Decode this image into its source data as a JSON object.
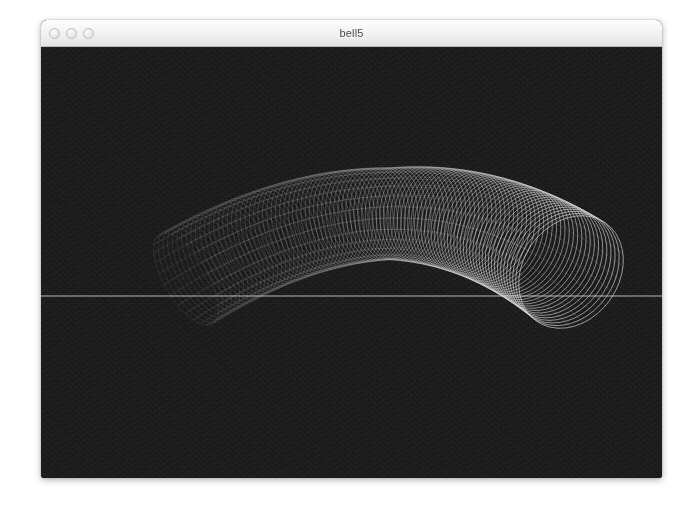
{
  "window": {
    "title": "bell5",
    "controls": [
      {
        "name": "close-button",
        "label": "close"
      },
      {
        "name": "minimize-button",
        "label": "minimize"
      },
      {
        "name": "zoom-button",
        "label": "zoom"
      }
    ],
    "frame": {
      "x": 41,
      "y": 20,
      "width": 621,
      "height": 458
    },
    "titlebar_height": 27
  },
  "canvas": {
    "name": "3d-wireframe-viewport",
    "width": 621,
    "height": 431,
    "background_color": "#141414",
    "wireframe_color": "#e8e8e8",
    "ground_line_color": "#cfcfcf"
  },
  "scene": {
    "object_name": "bell-tube-wireframe",
    "description": "Arched wireframe tube (bell curve sweep) rendered as a stack of overlapping circular cross-section rings",
    "ground_line_y": 249,
    "ring_count": 96,
    "ring_segments": 40,
    "path": {
      "start": {
        "x": 145,
        "y": 232
      },
      "peak": {
        "x": 360,
        "y": 105
      },
      "end": {
        "x": 530,
        "y": 225
      }
    },
    "radius": {
      "start": 52,
      "peak": 46,
      "end": 60
    },
    "near_end": "right",
    "far_end": "left"
  },
  "colors": {
    "titlebar_top": "#fdfdfd",
    "titlebar_bottom": "#e2e2e2",
    "titlebar_border": "#b9b9b9",
    "title_text": "#4a4a4a",
    "traffic_light_fill": "#eaeaea",
    "traffic_light_border": "#bdbdbd",
    "page_background": "#ffffff"
  }
}
